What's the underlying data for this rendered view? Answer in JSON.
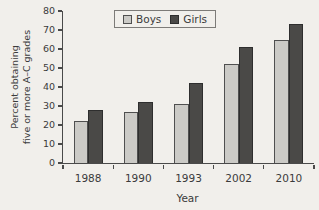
{
  "figure": {
    "background": "#f1efeb",
    "axis_color": "#4a4a4a",
    "text_color": "#3b3b3b"
  },
  "legend": {
    "position": "top-center",
    "items": [
      {
        "label": "Boys",
        "fill": "#cbcac6",
        "border": "#4f4f4f"
      },
      {
        "label": "Girls",
        "fill": "#4a4947",
        "border": "#2e2e2e"
      }
    ]
  },
  "chart_data": {
    "type": "bar",
    "title": "",
    "categories": [
      "1988",
      "1990",
      "1993",
      "2002",
      "2010"
    ],
    "series": [
      {
        "name": "Boys",
        "values": [
          22,
          27,
          31,
          52,
          65
        ],
        "fill": "#cbcac6",
        "border": "#4f4f4f"
      },
      {
        "name": "Girls",
        "values": [
          28,
          32,
          42,
          61,
          73
        ],
        "fill": "#4a4947",
        "border": "#2e2e2e"
      }
    ],
    "xlabel": "Year",
    "ylabel": "Percent obtaining five or more A–C grades",
    "ylabel_lines": [
      "Percent obtaining",
      "five or more A–C grades"
    ],
    "ylim": [
      0,
      80
    ],
    "yticks": [
      0,
      10,
      20,
      30,
      40,
      50,
      60,
      70,
      80
    ],
    "grid": false,
    "legend_position": "top-center"
  }
}
